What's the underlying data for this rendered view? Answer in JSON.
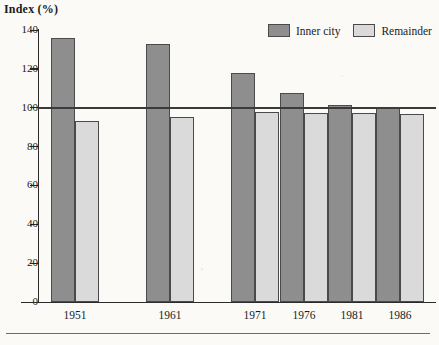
{
  "axis_title": "Index (%)",
  "legend": {
    "items": [
      {
        "label": "Inner city",
        "color": "#8e8e8e"
      },
      {
        "label": "Remainder",
        "color": "#dadada"
      }
    ]
  },
  "y_ticks": [
    {
      "label": "140",
      "value": 140
    },
    {
      "label": "120",
      "value": 120
    },
    {
      "label": "100",
      "value": 100
    },
    {
      "label": "80",
      "value": 80
    },
    {
      "label": "60",
      "value": 60
    },
    {
      "label": "40",
      "value": 40
    },
    {
      "label": "20",
      "value": 20
    },
    {
      "label": "0",
      "value": 0
    }
  ],
  "x_ticks": [
    {
      "label": "1951"
    },
    {
      "label": "1961"
    },
    {
      "label": "1971"
    },
    {
      "label": "1976"
    },
    {
      "label": "1981"
    },
    {
      "label": "1986"
    }
  ],
  "chart_data": {
    "type": "bar",
    "title": "",
    "xlabel": "",
    "ylabel": "Index (%)",
    "categories": [
      "1951",
      "1961",
      "1971",
      "1976",
      "1981",
      "1986"
    ],
    "series": [
      {
        "name": "Inner city",
        "color": "#8e8e8e",
        "values": [
          136,
          133,
          118,
          107.5,
          101.5,
          100
        ]
      },
      {
        "name": "Remainder",
        "color": "#dadada",
        "values": [
          93,
          95,
          98,
          97.5,
          97.5,
          97
        ]
      }
    ],
    "ylim": [
      0,
      140
    ],
    "ytick_step": 20,
    "grid": false,
    "reference_line": {
      "value": 100,
      "label": "100"
    },
    "legend_position": "top-right"
  }
}
